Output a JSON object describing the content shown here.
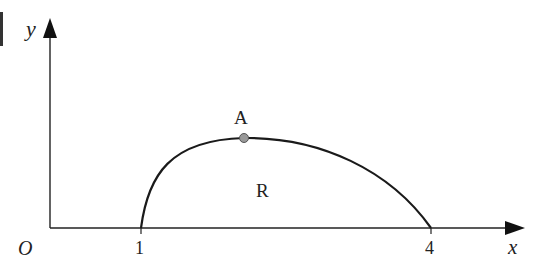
{
  "diagram": {
    "type": "curve-region",
    "axes": {
      "x_label": "x",
      "y_label": "y",
      "origin_label": "O",
      "x_ticks": [
        "1",
        "4"
      ]
    },
    "curve": {
      "start_x": "1",
      "end_x": "4",
      "point_label": "A",
      "region_label": "R"
    },
    "colors": {
      "stroke": "#1a1a1a",
      "point_fill": "#999999",
      "point_stroke": "#555555"
    }
  }
}
